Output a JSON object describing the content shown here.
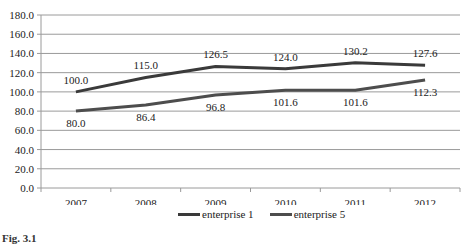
{
  "chart_data": {
    "type": "line",
    "title": "",
    "xlabel": "",
    "ylabel": "",
    "categories": [
      "2007",
      "2008",
      "2009",
      "2010",
      "2011",
      "2012"
    ],
    "series": [
      {
        "name": "enterprise 1",
        "color": "#3a3a3a",
        "values": [
          100.0,
          115.0,
          126.5,
          124.0,
          130.2,
          127.6
        ],
        "labels": [
          "100.0",
          "115.0",
          "126.5",
          "124.0",
          "130.2",
          "127.6"
        ],
        "label_position": "above"
      },
      {
        "name": "enterprise 5",
        "color": "#4d4d4d",
        "values": [
          80.0,
          86.4,
          96.8,
          101.6,
          101.6,
          112.3
        ],
        "labels": [
          "80.0",
          "86.4",
          "96.8",
          "101.6",
          "101.6",
          "112.3"
        ],
        "label_position": "below"
      }
    ],
    "ylim": [
      0,
      180
    ],
    "yticks": [
      "0.0",
      "20.0",
      "40.0",
      "60.0",
      "80.0",
      "100.0",
      "120.0",
      "140.0",
      "160.0",
      "180.0"
    ],
    "grid": true,
    "legend_position": "bottom"
  },
  "legend": {
    "items": [
      {
        "label": "enterprise 1",
        "color": "#3a3a3a"
      },
      {
        "label": "enterprise 5",
        "color": "#4d4d4d"
      }
    ]
  },
  "caption": "Fig. 3.1"
}
